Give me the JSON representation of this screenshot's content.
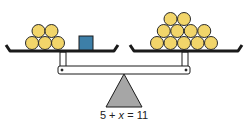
{
  "diagram": {
    "type": "balance-scale",
    "equation": {
      "left": "5 + ",
      "variable": "x",
      "right": " = 11"
    },
    "left_pan": {
      "coins": 5,
      "unknown_box": 1,
      "box_color": "#3d7fa8"
    },
    "right_pan": {
      "coins": 11
    },
    "colors": {
      "coin_fill": "#f2d56a",
      "coin_stroke": "#2a2a2a",
      "fulcrum_fill": "#a6a6a6",
      "line": "#1a1a1a"
    }
  }
}
